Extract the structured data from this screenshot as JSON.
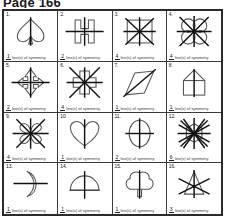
{
  "page": {
    "title": "Page 166",
    "caption_text": "line(s) of symmetry"
  },
  "worksheet": {
    "columns": 4,
    "rows": 4,
    "cells": [
      {
        "num": "1.",
        "shape": "spade",
        "answer": "1",
        "caption": "line(s) of symmetry"
      },
      {
        "num": "2.",
        "shape": "h-letter",
        "answer": "2",
        "caption": "line(s) of symmetry"
      },
      {
        "num": "3.",
        "shape": "square",
        "answer": "4",
        "caption": "line(s) of symmetry"
      },
      {
        "num": "4.",
        "shape": "four-petal",
        "answer": "4",
        "caption": "line(s) of symmetry"
      },
      {
        "num": "5.",
        "shape": "double-arrow",
        "answer": "2",
        "caption": "line(s) of symmetry"
      },
      {
        "num": "6.",
        "shape": "cross",
        "answer": "4",
        "caption": "line(s) of symmetry"
      },
      {
        "num": "7.",
        "shape": "parallelogram",
        "answer": "1",
        "caption": "line(s) of symmetry"
      },
      {
        "num": "8.",
        "shape": "house",
        "answer": "1",
        "caption": "line(s) of symmetry"
      },
      {
        "num": "9.",
        "shape": "clover-four",
        "answer": "4",
        "caption": "line(s) of symmetry"
      },
      {
        "num": "10.",
        "shape": "heart",
        "answer": "1",
        "caption": "line(s) of symmetry"
      },
      {
        "num": "11.",
        "shape": "ellipse",
        "answer": "2",
        "caption": "line(s) of symmetry"
      },
      {
        "num": "12.",
        "shape": "star-twelve",
        "answer": "6",
        "caption": "line(s) of symmetry"
      },
      {
        "num": "13.",
        "shape": "crescent",
        "answer": "1",
        "caption": "line(s) of symmetry"
      },
      {
        "num": "14.",
        "shape": "dome",
        "answer": "1",
        "caption": "line(s) of symmetry"
      },
      {
        "num": "15.",
        "shape": "clover-tree",
        "answer": "1",
        "caption": "line(s) of symmetry"
      },
      {
        "num": "16.",
        "shape": "triangle-star",
        "answer": "3",
        "caption": "line(s) of symmetry"
      }
    ]
  },
  "colors": {
    "border": "#2b2b2b",
    "grid_line": "#3a3a3a",
    "shape_stroke": "#555555",
    "symmetry_line": "#111111",
    "text": "#1a1a1a"
  }
}
